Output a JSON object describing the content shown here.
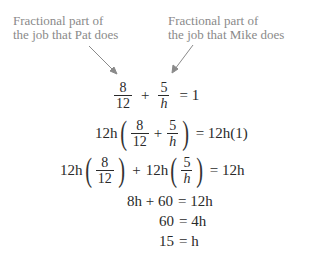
{
  "annotations": {
    "pat": {
      "line1": "Fractional part of",
      "line2": "the job that Pat does"
    },
    "mike": {
      "line1": "Fractional part of",
      "line2": "the job that Mike does"
    }
  },
  "equations": {
    "eq1": {
      "frac1_num": "8",
      "frac1_den": "12",
      "plus": "+",
      "frac2_num": "5",
      "frac2_den": "h",
      "rhs": "= 1"
    },
    "eq2": {
      "coef": "12h",
      "frac1_num": "8",
      "frac1_den": "12",
      "plus": "+",
      "frac2_num": "5",
      "frac2_den": "h",
      "rhs": "= 12h(1)"
    },
    "eq3": {
      "coef1": "12h",
      "frac1_num": "8",
      "frac1_den": "12",
      "plus": "+",
      "coef2": "12h",
      "frac2_num": "5",
      "frac2_den": "h",
      "rhs": "= 12h"
    },
    "eq4": {
      "lhs": "8h + 60",
      "rhs": "= 12h"
    },
    "eq5": {
      "lhs": "60",
      "rhs": "= 4h"
    },
    "eq6": {
      "lhs": "15",
      "rhs": "= h"
    }
  },
  "colors": {
    "annotation": "#8a8a8a",
    "equation": "#2a2a2a"
  }
}
